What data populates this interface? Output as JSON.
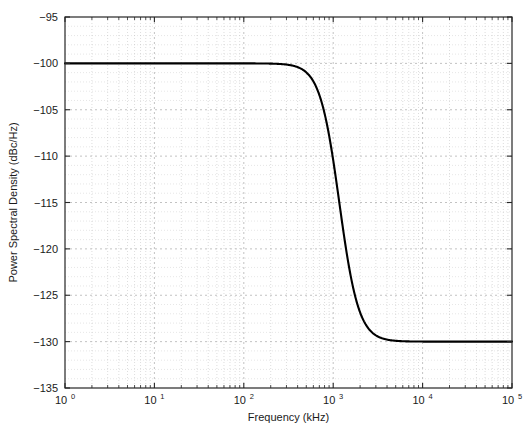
{
  "chart_data": {
    "type": "line",
    "title": "",
    "xlabel": "Frequency (kHz)",
    "ylabel": "Power Spectral Density (dBc/Hz)",
    "xscale": "log",
    "yscale": "linear",
    "xlim": [
      1,
      100000
    ],
    "ylim": [
      -135,
      -95
    ],
    "grid": true,
    "minor_grid": true,
    "legend": null,
    "line_color": "#000000",
    "grid_color": "#b3b3b3",
    "axis_color": "#262626",
    "background": "#ffffff",
    "xticks": [
      1,
      10,
      100,
      1000,
      10000,
      100000
    ],
    "xtick_labels": [
      "10^0",
      "10^1",
      "10^2",
      "10^3",
      "10^4",
      "10^5"
    ],
    "xtick_mantissas": [
      "10",
      "10",
      "10",
      "10",
      "10",
      "10"
    ],
    "xtick_exponents": [
      "0",
      "1",
      "2",
      "3",
      "4",
      "5"
    ],
    "yticks": [
      -95,
      -100,
      -105,
      -110,
      -115,
      -120,
      -125,
      -130,
      -135
    ],
    "ytick_labels": [
      "-95",
      "-100",
      "-105",
      "-110",
      "-115",
      "-120",
      "-125",
      "-130",
      "-135"
    ],
    "series": [
      {
        "name": "Phase Noise PSD",
        "plateau_low_db": -100,
        "plateau_high_db": -130,
        "corner_frequency_khz": 1170,
        "rolloff_db_per_decade": -40,
        "x": [
          1,
          1.6,
          2.5,
          4,
          6.3,
          10,
          16,
          25,
          40,
          63,
          100,
          160,
          250,
          400,
          630,
          1000,
          1170,
          1600,
          2500,
          4000,
          6300,
          10000,
          16000,
          25000,
          40000,
          63000,
          100000
        ],
        "y": [
          -100.0,
          -100.0,
          -100.0,
          -100.0,
          -100.0,
          -100.0,
          -100.0,
          -100.01,
          -100.02,
          -100.05,
          -100.12,
          -100.31,
          -101.11,
          -103.67,
          -108.23,
          -113.33,
          -115.0,
          -119.26,
          -124.06,
          -127.39,
          -129.03,
          -129.62,
          -129.86,
          -129.94,
          -129.98,
          -129.99,
          -130.0
        ]
      }
    ],
    "annotations": []
  }
}
